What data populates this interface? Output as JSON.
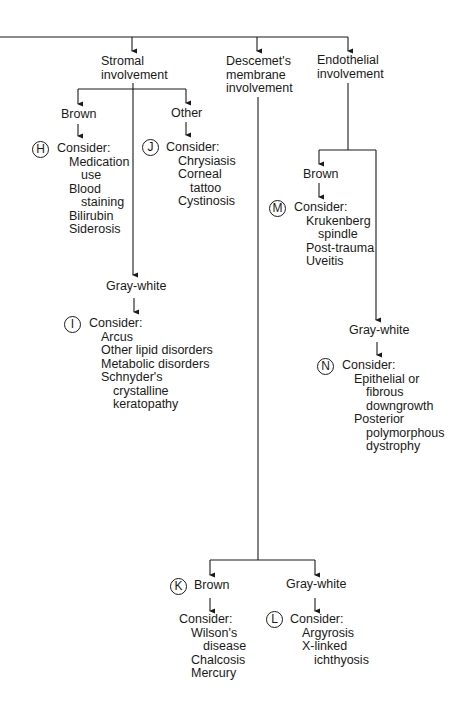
{
  "top_level": {
    "stromal": [
      "Stromal",
      "involvement"
    ],
    "descemet": [
      "Descemet's",
      "membrane",
      "involvement"
    ],
    "endothelial": [
      "Endothelial",
      "involvement"
    ]
  },
  "stromal": {
    "brown": {
      "label": "Brown",
      "marker": "H",
      "consider": "Consider:",
      "items": [
        "Medication",
        "use",
        "Blood",
        "staining",
        "Bilirubin",
        "Siderosis"
      ]
    },
    "other": {
      "label": "Other",
      "marker": "J",
      "consider": "Consider:",
      "items": [
        "Chrysiasis",
        "Corneal",
        "tattoo",
        "Cystinosis"
      ]
    },
    "gray_white": {
      "label": "Gray-white",
      "marker": "I",
      "consider": "Consider:",
      "items": [
        "Arcus",
        "Other lipid disorders",
        "Metabolic disorders",
        "Schnyder's",
        "crystalline",
        "keratopathy"
      ]
    }
  },
  "endothelial": {
    "brown": {
      "label": "Brown",
      "marker": "M",
      "consider": "Consider:",
      "items": [
        "Krukenberg",
        "spindle",
        "Post-trauma",
        "Uveitis"
      ]
    },
    "gray_white": {
      "label": "Gray-white",
      "marker": "N",
      "consider": "Consider:",
      "items": [
        "Epithelial or",
        "fibrous",
        "downgrowth",
        "Posterior",
        "polymorphous",
        "dystrophy"
      ]
    }
  },
  "descemet": {
    "brown": {
      "label": "Brown",
      "marker": "K",
      "consider": "Consider:",
      "items": [
        "Wilson's",
        "disease",
        "Chalcosis",
        "Mercury"
      ]
    },
    "gray_white": {
      "label": "Gray-white",
      "marker": "L",
      "consider": "Consider:",
      "items": [
        "Argyrosis",
        "X-linked",
        "ichthyosis"
      ]
    }
  },
  "colors": {
    "line": "#1a1a1a",
    "background": "#ffffff"
  }
}
